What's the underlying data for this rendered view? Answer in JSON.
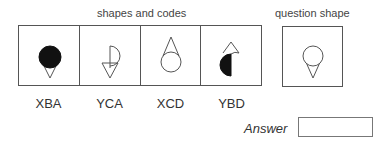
{
  "headers": {
    "shapes_and_codes": "shapes and codes",
    "question_shape": "question shape"
  },
  "shapes": [
    {
      "code": "XBA",
      "description": "filled circle above downward-pointing triangle"
    },
    {
      "code": "YCA",
      "description": "right half-circle with vertical line above downward-pointing triangle"
    },
    {
      "code": "XCD",
      "description": "open circle below upward-pointing triangle"
    },
    {
      "code": "YBD",
      "description": "filled left half-circle below upward-pointing triangle"
    }
  ],
  "question": {
    "description": "open circle above downward-pointing triangle"
  },
  "answer": {
    "label": "Answer",
    "value": ""
  },
  "colors": {
    "stroke": "#555555",
    "fill": "#111111"
  }
}
